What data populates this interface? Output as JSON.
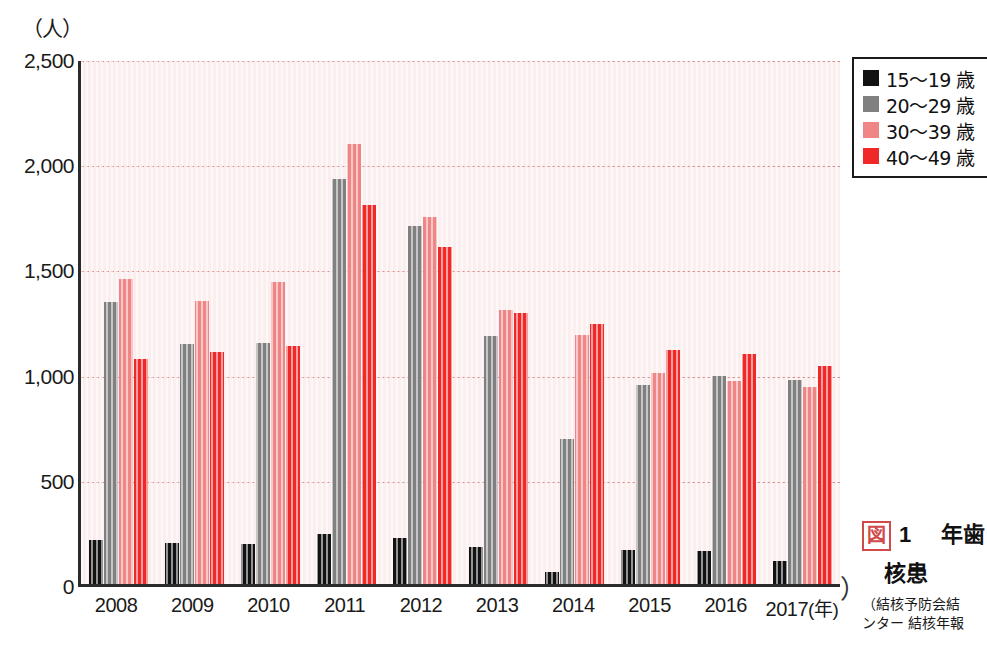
{
  "chart_data": {
    "type": "bar",
    "title_lines": [
      "年齢",
      "核患"
    ],
    "figure_label": "図",
    "figure_number": "1",
    "xlabel": "(年)",
    "ylabel": "(人)",
    "yunit": "（人）",
    "ylim": [
      0,
      2500
    ],
    "ytick_values": [
      2500,
      2000,
      1500,
      1000,
      500,
      0
    ],
    "ytick_labels": [
      "2,500",
      "2,000",
      "1,500",
      "1,000",
      "500",
      "0"
    ],
    "grid": true,
    "legend_position": "top-right",
    "categories": [
      "2008",
      "2009",
      "2010",
      "2011",
      "2012",
      "2013",
      "2014",
      "2015",
      "2016",
      "2017"
    ],
    "series": [
      {
        "name": "15〜19 歳",
        "color": "#121212",
        "values": [
          210,
          195,
          190,
          240,
          220,
          175,
          55,
          160,
          155,
          110
        ]
      },
      {
        "name": "20〜29 歳",
        "color": "#808080",
        "values": [
          1340,
          1140,
          1145,
          1925,
          1700,
          1180,
          690,
          945,
          990,
          970
        ]
      },
      {
        "name": "30〜39 歳",
        "color": "#ef8585",
        "values": [
          1450,
          1345,
          1435,
          2090,
          1745,
          1300,
          1185,
          1005,
          965,
          935
        ]
      },
      {
        "name": "40〜49 歳",
        "color": "#f02828",
        "values": [
          1070,
          1105,
          1130,
          1800,
          1600,
          1290,
          1235,
          1110,
          1095,
          1035
        ]
      }
    ],
    "source_lines": [
      "（結核予防会結",
      "ンター 結核年報"
    ]
  },
  "legend": {
    "items": [
      {
        "label": "15〜19 歳",
        "color": "#121212"
      },
      {
        "label": "20〜29 歳",
        "color": "#808080"
      },
      {
        "label": "30〜39 歳",
        "color": "#ef8585"
      },
      {
        "label": "40〜49 歳",
        "color": "#f02828"
      }
    ]
  },
  "caption": {
    "figure_label": "図",
    "figure_number": "1",
    "line1": "年歯",
    "line2": "核患",
    "source1": "（結核予防会結",
    "source2": "ンター 結核年報"
  },
  "axis": {
    "y_unit": "（人）",
    "x_unit": "(年)"
  }
}
